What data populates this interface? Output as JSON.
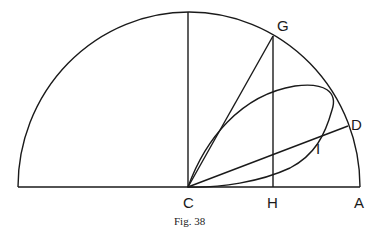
{
  "figure": {
    "caption": "Fig. 38",
    "points": {
      "C": "C",
      "H": "H",
      "A": "A",
      "G": "G",
      "D": "D",
      "I": "I"
    }
  },
  "colors": {
    "ink": "#1a1a1a",
    "background": "#ffffff"
  }
}
